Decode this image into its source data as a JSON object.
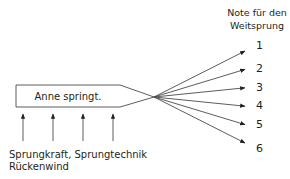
{
  "diagram": {
    "type": "flow-diagram",
    "process": {
      "label": "Anne springt."
    },
    "output_title": {
      "line1": "Note für den",
      "line2": "Weitsprung"
    },
    "outputs": [
      "1",
      "2",
      "3",
      "4",
      "5",
      "6"
    ],
    "input_factors": {
      "line1": "Sprungkraft, Sprungtechnik",
      "line2": "Rückenwind"
    },
    "input_arrow_count": 4,
    "colors": {
      "stroke": "#4a4a4a",
      "text": "#231f20",
      "background": "#ffffff"
    }
  }
}
